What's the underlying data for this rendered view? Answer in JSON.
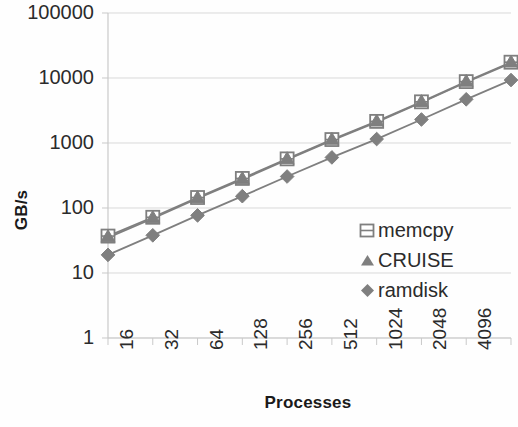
{
  "chart_data": {
    "type": "line",
    "title": "",
    "xlabel": "Processes",
    "ylabel": "GB/s",
    "x_scale": "log2",
    "y_scale": "log10",
    "grid": true,
    "legend_position": "inside-right",
    "categories": [
      "16",
      "32",
      "64",
      "128",
      "256",
      "512",
      "1024",
      "2048",
      "4096",
      "8192"
    ],
    "x_tick_labels": [
      "16",
      "32",
      "64",
      "128",
      "256",
      "512",
      "1024",
      "2048",
      "4096",
      "8192"
    ],
    "y_tick_labels": [
      "100000",
      "10000",
      "1000",
      "100",
      "10",
      "1"
    ],
    "ylim": [
      1,
      100000
    ],
    "series": [
      {
        "name": "memcpy",
        "marker": "square-open",
        "color": "#7f7f7f",
        "values": [
          37,
          72,
          145,
          285,
          570,
          1130,
          2150,
          4300,
          8800,
          17500
        ]
      },
      {
        "name": "CRUISE",
        "marker": "triangle",
        "color": "#7f7f7f",
        "values": [
          35,
          69,
          140,
          275,
          555,
          1100,
          2100,
          4200,
          8600,
          17000
        ]
      },
      {
        "name": "ramdisk",
        "marker": "diamond",
        "color": "#7f7f7f",
        "values": [
          19,
          38,
          77,
          152,
          305,
          600,
          1150,
          2300,
          4700,
          9300
        ]
      }
    ]
  },
  "legend": {
    "items": [
      {
        "label": "memcpy",
        "marker": "square-open-icon"
      },
      {
        "label": "CRUISE",
        "marker": "triangle-icon"
      },
      {
        "label": "ramdisk",
        "marker": "diamond-icon"
      }
    ]
  },
  "axes": {
    "x_title": "Processes",
    "y_title": "GB/s"
  },
  "colors": {
    "series": "#7f7f7f",
    "grid": "#d9d9d9",
    "axis": "#c9c9c9",
    "text": "#2b2b2b",
    "background": "#fefefe"
  }
}
